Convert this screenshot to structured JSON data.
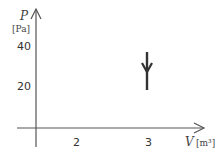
{
  "diagram": {
    "type": "pv-diagram",
    "y_axis": {
      "variable": "P",
      "unit": "[Pa]",
      "ticks": [
        "40",
        "20"
      ]
    },
    "x_axis": {
      "variable": "V",
      "unit": "[m³]",
      "ticks": [
        "2",
        "3"
      ]
    },
    "process": {
      "description": "isochoric pressure decrease at V = 3",
      "from": {
        "V": 3,
        "P": 35
      },
      "to": {
        "V": 3,
        "P": 18
      },
      "direction": "down"
    },
    "colors": {
      "axis": "#555555",
      "process": "#333333",
      "text": "#333333"
    }
  }
}
